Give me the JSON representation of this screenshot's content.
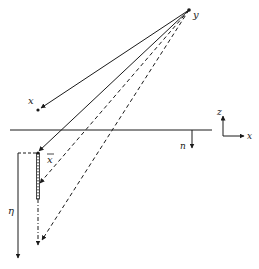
{
  "diagram": {
    "labels": {
      "y": "y",
      "x": "x",
      "x_bar": "x",
      "n": "n",
      "eta": "η",
      "axis_z": "z",
      "axis_x": "x"
    },
    "colors": {
      "stroke": "#1a1a1a",
      "background": "#ffffff"
    },
    "elements": {
      "source_point": "y",
      "receiver_point": "x",
      "image_point": "x̄",
      "surface_normal": "n",
      "depth_axis": "η"
    }
  }
}
